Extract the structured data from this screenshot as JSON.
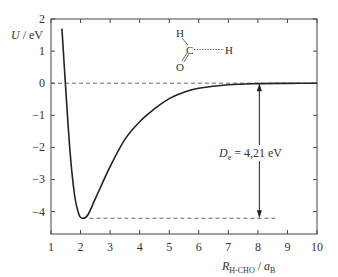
{
  "chart_data": {
    "type": "line",
    "title": "",
    "xlabel": "R_H-CHO / a_B",
    "xlabel_parts": {
      "main": "R",
      "sub": "H-CHO",
      "sep": " / ",
      "unit": "a",
      "unit_sub": "B"
    },
    "ylabel": "U / eV",
    "xlim": [
      1,
      10
    ],
    "ylim": [
      -4.7,
      2
    ],
    "xticks": [
      1,
      2,
      3,
      4,
      5,
      6,
      7,
      8,
      9,
      10
    ],
    "yticks": [
      2,
      1,
      0,
      -1,
      -2,
      -3,
      -4
    ],
    "ytick_labels": [
      "2",
      "1",
      "0",
      "−1",
      "−2",
      "−3",
      "−4"
    ],
    "grid": false,
    "series": [
      {
        "name": "U(R) potential energy curve",
        "x": [
          1.37,
          1.5,
          1.65,
          1.8,
          1.95,
          2.08,
          2.25,
          2.5,
          3.0,
          3.5,
          4.0,
          4.5,
          5.0,
          5.5,
          6.0,
          7.0,
          8.0,
          9.0,
          10.0
        ],
        "y": [
          1.7,
          -0.2,
          -2.2,
          -3.5,
          -4.1,
          -4.21,
          -4.1,
          -3.6,
          -2.6,
          -1.75,
          -1.2,
          -0.8,
          -0.48,
          -0.28,
          -0.16,
          -0.05,
          -0.015,
          -0.005,
          0.0
        ]
      }
    ],
    "reference_lines": [
      {
        "type": "hline",
        "y": 0,
        "style": "dashed",
        "x_from": 1,
        "x_to": 10
      },
      {
        "type": "hline",
        "y": -4.21,
        "style": "dashed",
        "x_from": 2.3,
        "x_to": 8.7
      }
    ],
    "annotations": [
      {
        "text": "D_e = 4,21 eV",
        "main": "D",
        "sub": "e",
        "rest": " = 4,21 eV",
        "x": 8.05,
        "y": -2.1,
        "arrow": "double",
        "from": 0,
        "to": -4.21
      },
      {
        "text": "H-C(=O)···H formaldehyde + H molecule sketch",
        "atoms": [
          "H",
          "C",
          "O",
          "H"
        ]
      }
    ]
  }
}
